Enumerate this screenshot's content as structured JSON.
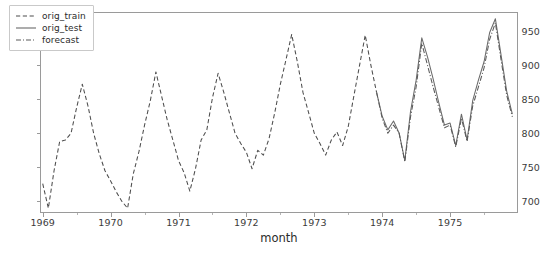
{
  "chart_data": {
    "type": "line",
    "title": "",
    "xlabel": "month",
    "ylabel": "",
    "xlim": [
      1968.96,
      1976.0
    ],
    "ylim": [
      683,
      978
    ],
    "grid": false,
    "legend_position": "upper left",
    "x_tick_labels": [
      "1969",
      "1970",
      "1971",
      "1972",
      "1973",
      "1974",
      "1975"
    ],
    "x_tick_values": [
      1969,
      1970,
      1971,
      1972,
      1973,
      1974,
      1975
    ],
    "y_tick_labels": [
      "700",
      "750",
      "800",
      "850",
      "900",
      "950"
    ],
    "y_tick_values": [
      700,
      750,
      800,
      850,
      900,
      950
    ],
    "series": [
      {
        "name": "orig_train",
        "style": "dashed",
        "color": "#4d4d4d",
        "x": [
          1969.0,
          1969.083,
          1969.167,
          1969.25,
          1969.333,
          1969.417,
          1969.5,
          1969.583,
          1969.667,
          1969.75,
          1969.833,
          1969.917,
          1970.0,
          1970.083,
          1970.167,
          1970.25,
          1970.333,
          1970.417,
          1970.5,
          1970.583,
          1970.667,
          1970.75,
          1970.833,
          1970.917,
          1971.0,
          1971.083,
          1971.167,
          1971.25,
          1971.333,
          1971.417,
          1971.5,
          1971.583,
          1971.667,
          1971.75,
          1971.833,
          1971.917,
          1972.0,
          1972.083,
          1972.167,
          1972.25,
          1972.333,
          1972.417,
          1972.5,
          1972.583,
          1972.667,
          1972.75,
          1972.833,
          1972.917,
          1973.0,
          1973.083,
          1973.167,
          1973.25,
          1973.333,
          1973.417,
          1973.5,
          1973.583,
          1973.667,
          1973.75,
          1973.833,
          1973.917
        ],
        "values": [
          726,
          690,
          745,
          788,
          790,
          800,
          838,
          872,
          840,
          800,
          770,
          745,
          730,
          714,
          700,
          690,
          740,
          773,
          812,
          847,
          890,
          855,
          820,
          790,
          760,
          742,
          715,
          748,
          790,
          805,
          852,
          888,
          860,
          830,
          800,
          785,
          772,
          748,
          775,
          768,
          792,
          830,
          872,
          908,
          945,
          905,
          860,
          830,
          800,
          785,
          768,
          790,
          802,
          782,
          810,
          855,
          900,
          944,
          900,
          860
        ]
      },
      {
        "name": "orig_test",
        "style": "solid",
        "color": "#6a6a6a",
        "x": [
          1973.917,
          1974.0,
          1974.083,
          1974.167,
          1974.25,
          1974.333,
          1974.417,
          1974.5,
          1974.583,
          1974.667,
          1974.75,
          1974.833,
          1974.917,
          1975.0,
          1975.083,
          1975.167,
          1975.25,
          1975.333,
          1975.417,
          1975.5,
          1975.583,
          1975.667,
          1975.75,
          1975.833,
          1975.917
        ],
        "values": [
          860,
          825,
          805,
          818,
          800,
          760,
          832,
          878,
          940,
          912,
          880,
          845,
          812,
          815,
          782,
          828,
          790,
          848,
          878,
          905,
          948,
          968,
          915,
          862,
          828
        ]
      },
      {
        "name": "forecast",
        "style": "dashdot",
        "color": "#5a5a5a",
        "x": [
          1973.917,
          1974.0,
          1974.083,
          1974.167,
          1974.25,
          1974.333,
          1974.417,
          1974.5,
          1974.583,
          1974.667,
          1974.75,
          1974.833,
          1974.917,
          1975.0,
          1975.083,
          1975.167,
          1975.25,
          1975.333,
          1975.417,
          1975.5,
          1975.583,
          1975.667,
          1975.75,
          1975.833,
          1975.917
        ],
        "values": [
          860,
          822,
          800,
          812,
          800,
          758,
          824,
          868,
          932,
          900,
          868,
          838,
          808,
          812,
          780,
          822,
          788,
          840,
          868,
          896,
          938,
          962,
          908,
          856,
          824
        ]
      }
    ]
  },
  "legend": {
    "entries": [
      {
        "label": "orig_train"
      },
      {
        "label": "orig_test"
      },
      {
        "label": "forecast"
      }
    ]
  },
  "axis": {
    "xlabel": "month"
  }
}
